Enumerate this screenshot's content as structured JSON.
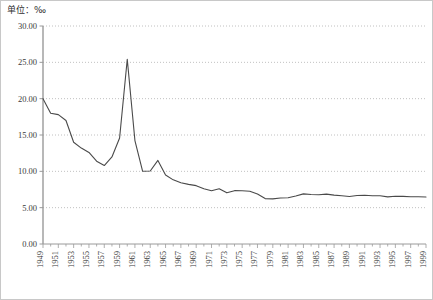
{
  "unit_label": "单位：‰",
  "colors": {
    "line": "#4a4a4a",
    "axis": "#9a9a9a",
    "grid": "#b0b0b0",
    "text": "#3a3a3a",
    "border": "#c8c8c8",
    "background": "#ffffff"
  },
  "chart_data": {
    "type": "line",
    "title": "",
    "subtitle": "",
    "xlabel": "",
    "ylabel": "",
    "unit": "‰",
    "grid": true,
    "legend": "none",
    "xlim": [
      1949,
      1999
    ],
    "ylim": [
      0.0,
      30.0
    ],
    "ytick_step": 5.0,
    "ytick_labels": [
      "0.00",
      "5.00",
      "10.00",
      "15.00",
      "20.00",
      "25.00",
      "30.00"
    ],
    "ytick_values": [
      0.0,
      5.0,
      10.0,
      15.0,
      20.0,
      25.0,
      30.0
    ],
    "xtick_labels": [
      "1949",
      "1951",
      "1953",
      "1955",
      "1957",
      "1959",
      "1961",
      "1963",
      "1965",
      "1967",
      "1969",
      "1971",
      "1973",
      "1975",
      "1977",
      "1979",
      "1981",
      "1983",
      "1985",
      "1987",
      "1989",
      "1991",
      "1993",
      "1995",
      "1997",
      "1999"
    ],
    "xtick_label_interval_years": 2,
    "minor_tick_interval_years": 1,
    "x": [
      1949,
      1950,
      1951,
      1952,
      1953,
      1954,
      1955,
      1956,
      1957,
      1958,
      1959,
      1960,
      1961,
      1962,
      1963,
      1964,
      1965,
      1966,
      1967,
      1968,
      1969,
      1970,
      1971,
      1972,
      1973,
      1974,
      1975,
      1976,
      1977,
      1978,
      1979,
      1980,
      1981,
      1982,
      1983,
      1984,
      1985,
      1986,
      1987,
      1988,
      1989,
      1990,
      1991,
      1992,
      1993,
      1994,
      1995,
      1996,
      1997,
      1998,
      1999
    ],
    "values": [
      20.0,
      18.0,
      17.8,
      17.0,
      14.0,
      13.2,
      12.6,
      11.4,
      10.8,
      11.98,
      14.59,
      25.43,
      14.24,
      10.02,
      10.04,
      11.5,
      9.5,
      8.83,
      8.43,
      8.21,
      8.03,
      7.6,
      7.32,
      7.61,
      7.04,
      7.34,
      7.32,
      7.25,
      6.87,
      6.25,
      6.21,
      6.34,
      6.36,
      6.6,
      6.9,
      6.82,
      6.78,
      6.86,
      6.72,
      6.64,
      6.54,
      6.67,
      6.7,
      6.64,
      6.64,
      6.49,
      6.57,
      6.56,
      6.51,
      6.5,
      6.46
    ],
    "series_name": "死亡率",
    "annotations": [
      {
        "year": 1960,
        "value": 25.43,
        "note": "peak"
      },
      {
        "year": 1949,
        "value": 20.0,
        "note": "start"
      },
      {
        "year": 1999,
        "value": 6.46,
        "note": "end"
      }
    ]
  },
  "plot_geometry": {
    "left": 42,
    "right": 425,
    "top": 25,
    "bottom": 243
  }
}
